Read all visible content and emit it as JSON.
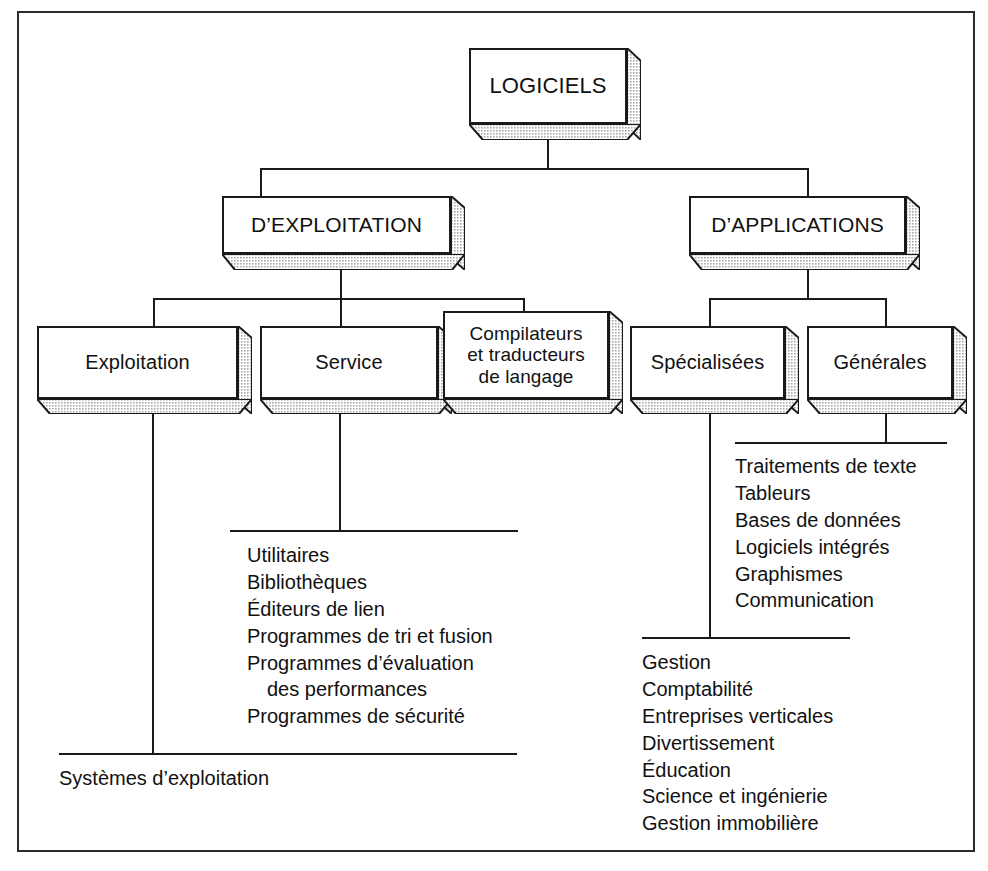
{
  "diagram": {
    "title": "LOGICIELS",
    "root": {
      "label": "LOGICIELS"
    },
    "level2": [
      {
        "label": "D’EXPLOITATION"
      },
      {
        "label": "D’APPLICATIONS"
      }
    ],
    "level3": [
      {
        "label": "Exploitation"
      },
      {
        "label": "Service"
      },
      {
        "label": "Compilateurs\net traducteurs\nde langage"
      },
      {
        "label": "Spécialisées"
      },
      {
        "label": "Générales"
      }
    ],
    "boxes": {
      "logiciels": "LOGICIELS",
      "exploitation_branch": "D’EXPLOITATION",
      "applications_branch": "D’APPLICATIONS",
      "exploitation": "Exploitation",
      "service": "Service",
      "compilateurs_line1": "Compilateurs",
      "compilateurs_line2": "et traducteurs",
      "compilateurs_line3": "de langage",
      "specialisees": "Spécialisées",
      "generales": "Générales"
    },
    "lists": {
      "exploitation_items": [
        "Systèmes d’exploitation"
      ],
      "service_items": [
        "Utilitaires",
        "Bibliothèques",
        "Éditeurs de lien",
        "Programmes de tri et fusion",
        "Programmes d’évaluation",
        "des performances",
        "Programmes de sécurité"
      ],
      "specialisees_items": [
        "Gestion",
        "Comptabilité",
        "Entreprises verticales",
        "Divertissement",
        "Éducation",
        "Science et ingénierie",
        "Gestion immobilière"
      ],
      "generales_items": [
        "Traitements de texte",
        "Tableurs",
        "Bases de données",
        "Logiciels intégrés",
        "Graphismes",
        "Communication"
      ]
    },
    "colors": {
      "line": "#1a1a1a",
      "frame": "#2b2b2b",
      "box_fill": "#ffffff",
      "shade_fill": "#c9c9c9",
      "text": "#111111",
      "background": "#ffffff"
    }
  }
}
